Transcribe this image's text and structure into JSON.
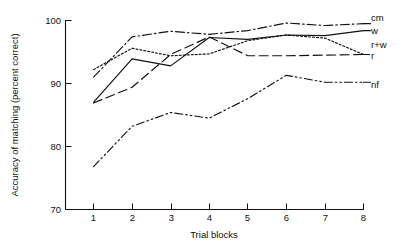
{
  "chart_data": {
    "type": "line",
    "title": "",
    "xlabel": "Trial blocks",
    "ylabel": "Accuracy of matching (percent correct)",
    "x": [
      1,
      2,
      3,
      4,
      5,
      6,
      7,
      8
    ],
    "xtick_labels": [
      "1",
      "2",
      "3",
      "4",
      "5",
      "6",
      "7",
      "8"
    ],
    "ytick_labels": [
      "70",
      "80",
      "90",
      "100"
    ],
    "yticks": [
      70,
      80,
      90,
      100
    ],
    "xlim": [
      0.7,
      8.3
    ],
    "ylim": [
      70,
      100
    ],
    "grid": false,
    "legend_position": "right-of-axes-inline",
    "series": [
      {
        "name": "cm",
        "label": "cm",
        "linestyle": "dash-dot",
        "values": [
          91.0,
          97.4,
          98.3,
          97.8,
          98.4,
          99.6,
          99.2,
          99.5
        ]
      },
      {
        "name": "w",
        "label": "w",
        "linestyle": "solid",
        "values": [
          87.0,
          93.9,
          92.8,
          97.3,
          97.0,
          97.7,
          97.6,
          98.4
        ]
      },
      {
        "name": "r+w",
        "label": "r+w",
        "linestyle": "dotted",
        "values": [
          92.2,
          95.6,
          94.4,
          94.7,
          96.8,
          97.7,
          97.2,
          94.6
        ]
      },
      {
        "name": "r",
        "label": "r",
        "linestyle": "long-dash",
        "values": [
          86.9,
          89.4,
          94.6,
          97.4,
          94.4,
          94.4,
          94.5,
          94.6
        ]
      },
      {
        "name": "nf",
        "label": "nf",
        "linestyle": "dash-dot-dot",
        "values": [
          76.8,
          83.2,
          85.4,
          84.5,
          87.6,
          91.3,
          90.2,
          90.2
        ]
      }
    ]
  }
}
